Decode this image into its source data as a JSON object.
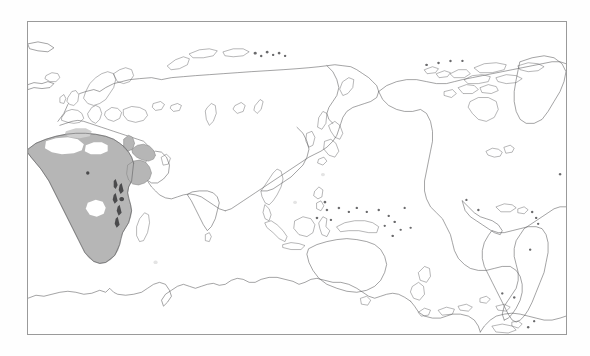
{
  "figure": {
    "type": "distribution-range-map",
    "title": "",
    "caption": "",
    "projection": "Pacific-centred equirectangular world map",
    "background_color": "#fefefe",
    "frame": {
      "visible": true,
      "border_color": "#9a9a9a",
      "border_width_px": 1,
      "x": 27,
      "y": 21,
      "width": 540,
      "height": 314
    },
    "land": {
      "fill_color": "#ffffff",
      "outline_color": "#58585a",
      "outline_width_px": 0.55
    },
    "legend": {
      "visible": false,
      "entries": [
        {
          "label": "Distribution range",
          "color": "#b6b6b6"
        },
        {
          "label": "Absent / gap",
          "color": "#ffffff"
        }
      ]
    },
    "range": {
      "fill_color": "#b6b6b6",
      "outline_color": "#7d7d7d",
      "hole_color": "#ffffff",
      "mark_color": "#4a4a4c",
      "regions": [
        "North Africa",
        "Sahel",
        "West Africa",
        "Central Africa",
        "East Africa",
        "Southern Africa",
        "south-western Arabian Peninsula"
      ],
      "gaps": [
        "central Sahara",
        "western Sahara interior",
        "Congo basin interior"
      ]
    },
    "landmasses": [
      "Europe",
      "Africa",
      "Asia",
      "Australia",
      "New Zealand",
      "New Guinea",
      "Indonesia",
      "Japan",
      "Greenland",
      "North America",
      "Central America",
      "South America",
      "Antarctica",
      "Madagascar",
      "Sri Lanka",
      "British Isles",
      "Iceland",
      "Philippines"
    ],
    "axes": {
      "visible": false,
      "x_ticks": [],
      "y_ticks": [],
      "xlabel": "",
      "ylabel": ""
    }
  },
  "chart_data": {
    "type": "map",
    "title": "",
    "xlabel": "",
    "ylabel": "",
    "projection": "equirectangular",
    "center_longitude": 150,
    "xlim": [
      -180,
      180
    ],
    "ylim": [
      -90,
      90
    ],
    "grid": false,
    "legend_position": "none",
    "series": [
      {
        "name": "Shaded distribution range",
        "color": "#b6b6b6",
        "regions": [
          "Morocco",
          "Algeria",
          "Tunisia",
          "Libya",
          "Egypt",
          "Mauritania",
          "Mali",
          "Niger",
          "Chad",
          "Sudan",
          "Senegal",
          "Guinea",
          "Ivory Coast",
          "Ghana",
          "Nigeria",
          "Cameroon",
          "Central African Republic",
          "Ethiopia",
          "Somalia",
          "Kenya",
          "Tanzania",
          "Democratic Republic of the Congo",
          "Angola",
          "Zambia",
          "Zimbabwe",
          "Mozambique",
          "Botswana",
          "Namibia",
          "South Africa",
          "Yemen",
          "south-west Saudi Arabia"
        ],
        "value": 1
      },
      {
        "name": "Unshaded gaps within range",
        "color": "#ffffff",
        "regions": [
          "central Sahara",
          "western Sahara",
          "Congo basin"
        ],
        "value": 0
      }
    ]
  }
}
